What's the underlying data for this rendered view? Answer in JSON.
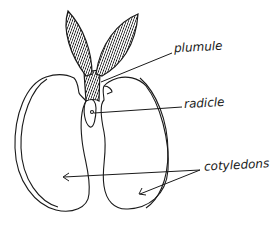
{
  "diagram": {
    "type": "labeled illustration",
    "style": "hand-drawn pen sketch",
    "colors": {
      "ink": "#1a1a1a",
      "background": "#ffffff"
    },
    "labels": [
      {
        "id": "plumule",
        "text": "plumule",
        "points_to": "shoot / leaves (plumule)"
      },
      {
        "id": "radicle",
        "text": "radicle",
        "points_to": "embryonic root (radicle)"
      },
      {
        "id": "cotyledons",
        "text": "cotyledons",
        "points_to": [
          "left cotyledon",
          "right cotyledon"
        ]
      }
    ],
    "parts": [
      "left leaf",
      "right leaf",
      "stem",
      "radicle",
      "left cotyledon",
      "right cotyledon"
    ]
  }
}
